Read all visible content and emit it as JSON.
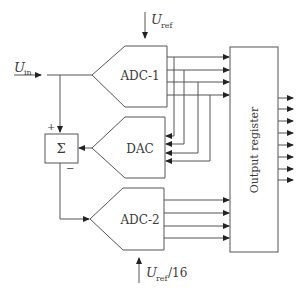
{
  "diagram": {
    "inputs": {
      "u_in": {
        "symbol": "U",
        "subscript": "in"
      },
      "u_ref": {
        "symbol": "U",
        "subscript": "ref"
      },
      "u_ref16": {
        "symbol": "U",
        "subscript": "ref",
        "suffix": "/16"
      }
    },
    "blocks": {
      "adc1": "ADC-1",
      "dac": "DAC",
      "adc2": "ADC-2",
      "sum": "Σ",
      "register": "Output register"
    },
    "signs": {
      "plus": "+",
      "minus": "−"
    },
    "bits": {
      "adc1_outputs": 4,
      "dac_inputs": 4,
      "adc2_outputs": 4,
      "register_outputs": 8
    },
    "colors": {
      "line": "#555555",
      "arrow": "#222222",
      "text": "#3a3a3a"
    }
  }
}
